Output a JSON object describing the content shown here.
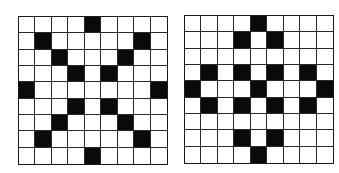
{
  "figure": {
    "rows": 9,
    "cols": 9,
    "colors": {
      "filled": "#0a0a0a",
      "empty": "#ffffff",
      "line": "#2a2a2a"
    },
    "grids": [
      {
        "id": "left",
        "filled_cells": [
          [
            0,
            4
          ],
          [
            1,
            1
          ],
          [
            1,
            7
          ],
          [
            2,
            2
          ],
          [
            2,
            6
          ],
          [
            3,
            3
          ],
          [
            3,
            5
          ],
          [
            4,
            0
          ],
          [
            4,
            8
          ],
          [
            5,
            3
          ],
          [
            5,
            5
          ],
          [
            6,
            2
          ],
          [
            6,
            6
          ],
          [
            7,
            1
          ],
          [
            7,
            7
          ],
          [
            8,
            4
          ]
        ]
      },
      {
        "id": "right",
        "filled_cells": [
          [
            0,
            4
          ],
          [
            1,
            3
          ],
          [
            1,
            5
          ],
          [
            3,
            1
          ],
          [
            3,
            3
          ],
          [
            3,
            5
          ],
          [
            3,
            7
          ],
          [
            4,
            0
          ],
          [
            4,
            4
          ],
          [
            4,
            8
          ],
          [
            5,
            1
          ],
          [
            5,
            3
          ],
          [
            5,
            5
          ],
          [
            5,
            7
          ],
          [
            7,
            3
          ],
          [
            7,
            5
          ],
          [
            8,
            4
          ]
        ]
      }
    ]
  }
}
